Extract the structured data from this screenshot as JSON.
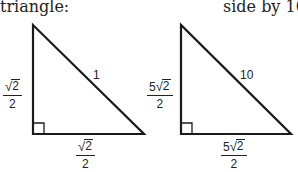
{
  "captions": {
    "left": "triangle:",
    "right": "side by 10:"
  },
  "left_triangle": {
    "hypotenuse_label": "1",
    "vertical_leg": {
      "coefficient": "",
      "radicand": "2",
      "denominator": "2"
    },
    "horizontal_leg": {
      "coefficient": "",
      "radicand": "2",
      "denominator": "2"
    },
    "right_angle_marker": true
  },
  "right_triangle": {
    "hypotenuse_label": "10",
    "vertical_leg": {
      "coefficient": "5",
      "radicand": "2",
      "denominator": "2"
    },
    "horizontal_leg": {
      "coefficient": "5",
      "radicand": "2",
      "denominator": "2"
    },
    "right_angle_marker": true
  },
  "symbols": {
    "radical": "√"
  },
  "colors": {
    "stroke": "#1a1a1a",
    "text": "#222222",
    "background": "#ffffff"
  }
}
